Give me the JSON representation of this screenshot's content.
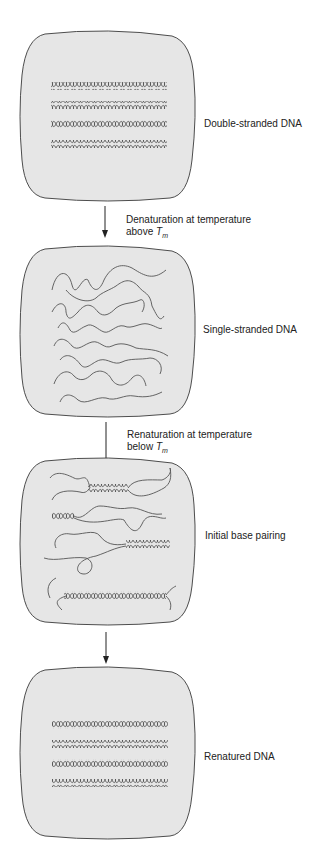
{
  "figure": {
    "fill_color": "#e6e6e6",
    "stroke_color": "#3a3a3a",
    "panels": [
      {
        "id": "panel-1",
        "label": "Double-stranded DNA",
        "content": "4 double helices"
      },
      {
        "id": "panel-2",
        "label": "Single-stranded DNA",
        "content": "separated random-coil strands"
      },
      {
        "id": "panel-3",
        "label": "Initial base pairing",
        "content": "partially paired strands"
      },
      {
        "id": "panel-4",
        "label": "Renatured DNA",
        "content": "4 double helices"
      }
    ],
    "steps": [
      {
        "line1": "Denaturation at temperature",
        "line2_prefix": "above ",
        "symbol": "T",
        "subscript": "m"
      },
      {
        "line1": "Renaturation at temperature",
        "line2_prefix": "below ",
        "symbol": "T",
        "subscript": "m"
      },
      {
        "line1": "",
        "line2_prefix": "",
        "symbol": "",
        "subscript": ""
      }
    ]
  }
}
